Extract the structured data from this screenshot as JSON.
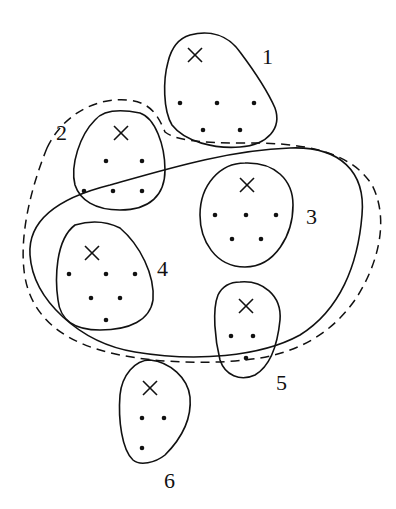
{
  "diagram": {
    "type": "cluster-partition",
    "clusters": [
      {
        "id": "1",
        "label": "1",
        "center": [
          195,
          55
        ],
        "points": [
          [
            180,
            103
          ],
          [
            217,
            103
          ],
          [
            254,
            103
          ],
          [
            203,
            130
          ],
          [
            240,
            130
          ]
        ]
      },
      {
        "id": "2",
        "label": "2",
        "center": [
          120,
          133
        ],
        "points": [
          [
            106,
            161
          ],
          [
            142,
            161
          ],
          [
            84,
            191
          ],
          [
            113,
            191
          ],
          [
            142,
            191
          ]
        ]
      },
      {
        "id": "3",
        "label": "3",
        "center": [
          247,
          185
        ],
        "points": [
          [
            215,
            215
          ],
          [
            246,
            215
          ],
          [
            276,
            215
          ],
          [
            232,
            239
          ],
          [
            261,
            239
          ]
        ]
      },
      {
        "id": "4",
        "label": "4",
        "center": [
          92,
          253
        ],
        "points": [
          [
            69,
            274
          ],
          [
            106,
            274
          ],
          [
            135,
            274
          ],
          [
            91,
            298
          ],
          [
            120,
            298
          ],
          [
            106,
            320
          ]
        ]
      },
      {
        "id": "5",
        "label": "5",
        "center": [
          246,
          306
        ],
        "points": [
          [
            231,
            336
          ],
          [
            253,
            336
          ],
          [
            246,
            358
          ]
        ]
      },
      {
        "id": "6",
        "label": "6",
        "center": [
          150,
          388
        ],
        "points": [
          [
            142,
            418
          ],
          [
            164,
            418
          ],
          [
            142,
            448
          ]
        ]
      }
    ],
    "regions": [
      {
        "name": "solid-outer-region",
        "style": "solid",
        "contains": [
          "3",
          "4",
          "5"
        ]
      },
      {
        "name": "dashed-outer-region",
        "style": "dashed",
        "contains": [
          "2",
          "3",
          "4",
          "5"
        ]
      }
    ]
  },
  "labels": {
    "c1": "1",
    "c2": "2",
    "c3": "3",
    "c4": "4",
    "c5": "5",
    "c6": "6"
  }
}
